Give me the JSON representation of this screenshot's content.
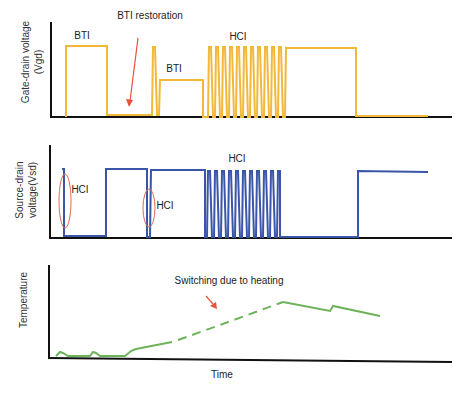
{
  "diagram": {
    "panels": [
      {
        "id": "vgd",
        "y_label_line1": "Gate-drain voltage",
        "y_label_line2": "(Vgd)",
        "color": "#F2B83A",
        "annotations": {
          "top": "BTI restoration",
          "bti1": "BTI",
          "bti2": "BTI",
          "hci": "HCI"
        },
        "arrow_color": "#E8503A"
      },
      {
        "id": "vsd",
        "y_label_line1": "Source-drain",
        "y_label_line2": "voltage(Vsd)",
        "color": "#3B56A8",
        "annotations": {
          "hci1": "HCI",
          "hci2": "HCI",
          "hci3": "HCI"
        },
        "ellipse_color": "#E06A55"
      },
      {
        "id": "temp",
        "y_label_line1": "Temperature",
        "color": "#6DB35A",
        "annotations": {
          "switching": "Switching due to heating"
        },
        "arrow_color": "#E8503A"
      }
    ],
    "x_label": "Time",
    "axis_color": "#111111"
  }
}
